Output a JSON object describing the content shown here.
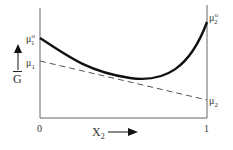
{
  "diagram": {
    "type": "gibbs-free-energy-curve",
    "y_axis": {
      "label": "G",
      "overbar": true,
      "arrow": "up"
    },
    "x_axis": {
      "label": "X",
      "label_subscript": "2",
      "arrow": "right",
      "ticks": [
        "0",
        "1"
      ]
    },
    "left_labels": {
      "mu1_standard": {
        "base": "μ",
        "sup": "o",
        "sub": "1"
      },
      "mu1": {
        "base": "μ",
        "sub": "1"
      }
    },
    "right_labels": {
      "mu2_standard": {
        "base": "μ",
        "sup": "o",
        "sub": "2"
      },
      "mu2": {
        "base": "μ",
        "sub": "2"
      }
    },
    "curves": [
      {
        "name": "G-mix-curve",
        "style": "solid-thick",
        "color": "#111111"
      },
      {
        "name": "tangent-line",
        "style": "dashed",
        "color": "#555555"
      }
    ]
  }
}
